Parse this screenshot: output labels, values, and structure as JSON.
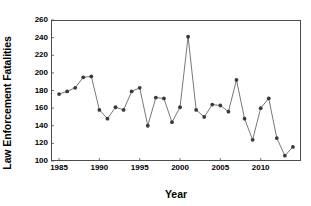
{
  "chart_data": {
    "type": "line",
    "title": "",
    "xlabel": "Year",
    "ylabel": "Law Enforcement Fatalities",
    "xlim": [
      1984,
      2015
    ],
    "ylim": [
      100,
      260
    ],
    "yticks": [
      100,
      120,
      140,
      160,
      180,
      200,
      220,
      240,
      260
    ],
    "xticks": [
      1985,
      1990,
      1995,
      2000,
      2005,
      2010
    ],
    "grid": false,
    "legend": false,
    "marker": "filled-circle",
    "marker_color": "#3a3a3a",
    "line_color": "#555555",
    "x": [
      1985,
      1986,
      1987,
      1988,
      1989,
      1990,
      1991,
      1992,
      1993,
      1994,
      1995,
      1996,
      1997,
      1998,
      1999,
      2000,
      2001,
      2002,
      2003,
      2004,
      2005,
      2006,
      2007,
      2008,
      2009,
      2010,
      2011,
      2012,
      2013,
      2014
    ],
    "values": [
      176,
      179,
      183,
      195,
      196,
      158,
      148,
      161,
      158,
      179,
      183,
      140,
      172,
      171,
      144,
      161,
      241,
      158,
      150,
      164,
      163,
      156,
      192,
      148,
      124,
      160,
      171,
      126,
      106,
      116
    ]
  },
  "axes": {
    "ylabel": "Law Enforcement Fatalities",
    "xlabel": "Year",
    "ytick_labels": [
      "260",
      "240",
      "220",
      "200",
      "180",
      "160",
      "140",
      "120",
      "100"
    ],
    "xtick_labels": [
      "1985",
      "1990",
      "1995",
      "2000",
      "2005",
      "2010"
    ]
  }
}
